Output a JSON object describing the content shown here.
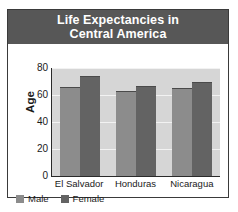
{
  "chart_data": {
    "type": "bar",
    "title": "Life Expectancies in\nCentral America",
    "title_line1": "Life Expectancies in",
    "title_line2": "Central America",
    "xlabel": "",
    "ylabel": "Age",
    "categories": [
      "El Salvador",
      "Honduras",
      "Nicaragua"
    ],
    "series": [
      {
        "name": "Male",
        "color": "#8c8c8c",
        "values": [
          66,
          63,
          65
        ]
      },
      {
        "name": "Female",
        "color": "#636363",
        "values": [
          74,
          67,
          70
        ]
      }
    ],
    "ylim": [
      0,
      80
    ],
    "ytick_labels": [
      "80",
      "60",
      "40",
      "20",
      "0"
    ],
    "ytick_values": [
      80,
      60,
      40,
      20,
      0
    ],
    "grid": true,
    "legend_position": "bottom-left",
    "plot_background": "#d6d6d6",
    "title_background": "#575757",
    "title_color": "#ffffff"
  }
}
